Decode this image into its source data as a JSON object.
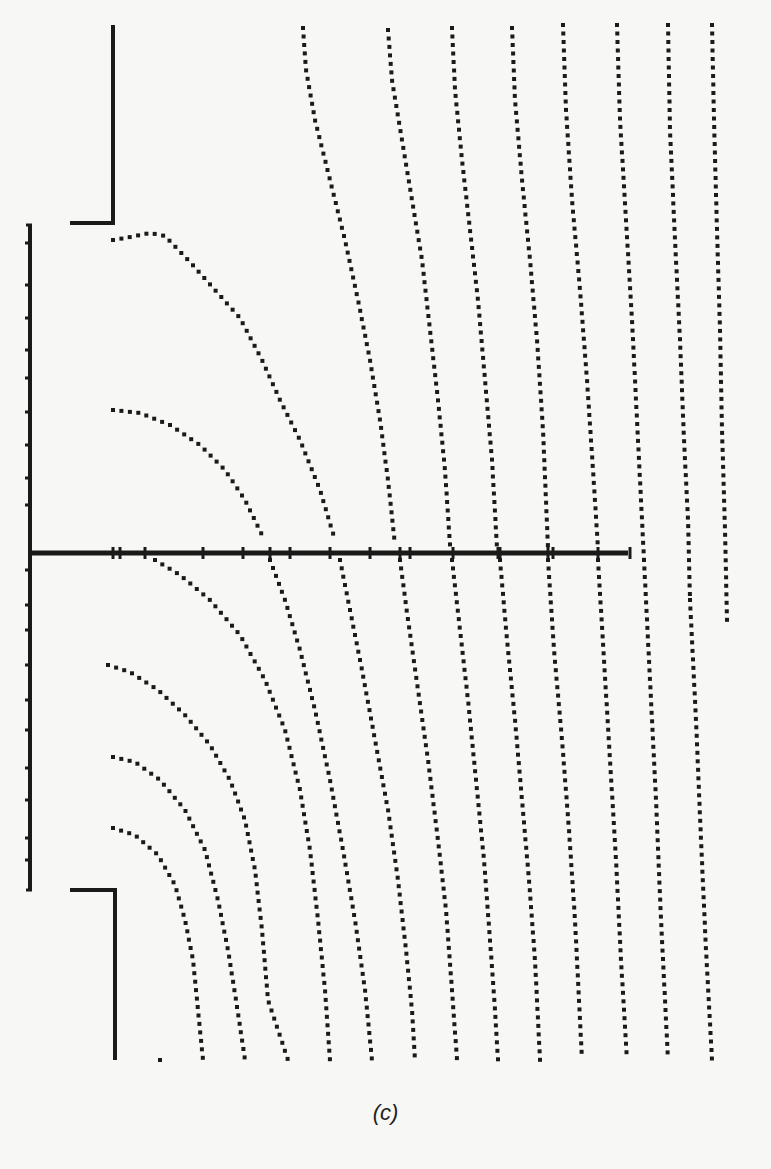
{
  "figure": {
    "caption": "(c)",
    "ink_color": "#1a1a1a",
    "paper_color": "#f7f7f5",
    "dot_size": 4
  },
  "structure": {
    "axis": {
      "x1": 30,
      "x2": 628,
      "y": 553,
      "width": 5
    },
    "axis_ticks_x": [
      113,
      120,
      145,
      203,
      243,
      270,
      290,
      330,
      370,
      400,
      410,
      453,
      498,
      500,
      548,
      553,
      598,
      630
    ],
    "left_electrode": {
      "x": 30,
      "y1": 225,
      "y2": 890,
      "width": 4
    },
    "left_ticks_y": [
      243,
      285,
      318,
      350,
      378,
      412,
      445,
      478,
      505,
      570,
      605,
      630,
      665,
      700,
      730,
      768,
      800,
      838,
      860
    ],
    "upper_plate": {
      "vx": 113,
      "vy1": 25,
      "vy2": 223,
      "hx1": 70,
      "hx2": 113
    },
    "lower_plate": {
      "vx": 115,
      "vy1": 890,
      "vy2": 1060,
      "hx1": 70,
      "hx2": 115
    }
  },
  "curves": [
    {
      "name": "arc-upper-1",
      "points": [
        [
          113,
          240
        ],
        [
          125,
          238
        ],
        [
          150,
          233
        ],
        [
          165,
          236
        ],
        [
          190,
          262
        ],
        [
          215,
          290
        ],
        [
          240,
          318
        ],
        [
          262,
          360
        ],
        [
          280,
          400
        ],
        [
          300,
          440
        ],
        [
          320,
          490
        ],
        [
          335,
          540
        ]
      ]
    },
    {
      "name": "arc-upper-2",
      "points": [
        [
          113,
          410
        ],
        [
          140,
          413
        ],
        [
          170,
          425
        ],
        [
          200,
          445
        ],
        [
          225,
          470
        ],
        [
          245,
          500
        ],
        [
          262,
          535
        ]
      ]
    },
    {
      "name": "field-1-upper",
      "points": [
        [
          303,
          28
        ],
        [
          306,
          70
        ],
        [
          315,
          120
        ],
        [
          330,
          180
        ],
        [
          345,
          240
        ],
        [
          358,
          300
        ],
        [
          370,
          360
        ],
        [
          380,
          420
        ],
        [
          388,
          480
        ],
        [
          395,
          545
        ]
      ]
    },
    {
      "name": "field-2-upper",
      "points": [
        [
          388,
          30
        ],
        [
          392,
          80
        ],
        [
          402,
          140
        ],
        [
          412,
          200
        ],
        [
          422,
          260
        ],
        [
          430,
          330
        ],
        [
          438,
          400
        ],
        [
          445,
          470
        ],
        [
          450,
          545
        ]
      ]
    },
    {
      "name": "field-3-upper",
      "points": [
        [
          452,
          28
        ],
        [
          455,
          90
        ],
        [
          462,
          160
        ],
        [
          470,
          230
        ],
        [
          478,
          300
        ],
        [
          485,
          380
        ],
        [
          492,
          460
        ],
        [
          497,
          548
        ]
      ]
    },
    {
      "name": "field-4-upper",
      "points": [
        [
          512,
          28
        ],
        [
          515,
          100
        ],
        [
          522,
          180
        ],
        [
          530,
          260
        ],
        [
          537,
          340
        ],
        [
          543,
          430
        ],
        [
          548,
          548
        ]
      ]
    },
    {
      "name": "field-5-upper",
      "points": [
        [
          563,
          25
        ],
        [
          566,
          110
        ],
        [
          572,
          200
        ],
        [
          580,
          290
        ],
        [
          587,
          380
        ],
        [
          593,
          470
        ],
        [
          598,
          548
        ]
      ]
    },
    {
      "name": "field-6-upper",
      "points": [
        [
          617,
          25
        ],
        [
          620,
          120
        ],
        [
          626,
          220
        ],
        [
          632,
          320
        ],
        [
          637,
          420
        ],
        [
          641,
          500
        ],
        [
          644,
          560
        ]
      ]
    },
    {
      "name": "field-7-upper",
      "points": [
        [
          668,
          25
        ],
        [
          670,
          130
        ],
        [
          675,
          240
        ],
        [
          680,
          340
        ],
        [
          684,
          440
        ],
        [
          688,
          520
        ],
        [
          690,
          600
        ]
      ]
    },
    {
      "name": "field-8-upper",
      "points": [
        [
          712,
          25
        ],
        [
          714,
          120
        ],
        [
          717,
          230
        ],
        [
          720,
          330
        ],
        [
          722,
          430
        ],
        [
          725,
          530
        ],
        [
          727,
          620
        ]
      ]
    },
    {
      "name": "field-1-lower",
      "points": [
        [
          155,
          560
        ],
        [
          180,
          575
        ],
        [
          210,
          600
        ],
        [
          240,
          635
        ],
        [
          265,
          680
        ],
        [
          285,
          730
        ],
        [
          300,
          790
        ],
        [
          310,
          850
        ],
        [
          318,
          920
        ],
        [
          325,
          990
        ],
        [
          330,
          1060
        ]
      ]
    },
    {
      "name": "field-2-lower",
      "points": [
        [
          270,
          560
        ],
        [
          285,
          600
        ],
        [
          300,
          650
        ],
        [
          315,
          710
        ],
        [
          330,
          780
        ],
        [
          343,
          850
        ],
        [
          355,
          920
        ],
        [
          365,
          990
        ],
        [
          372,
          1060
        ]
      ]
    },
    {
      "name": "field-3-lower",
      "points": [
        [
          340,
          560
        ],
        [
          350,
          610
        ],
        [
          362,
          670
        ],
        [
          375,
          740
        ],
        [
          388,
          810
        ],
        [
          398,
          880
        ],
        [
          406,
          950
        ],
        [
          412,
          1010
        ],
        [
          415,
          1060
        ]
      ]
    },
    {
      "name": "field-4-lower",
      "points": [
        [
          400,
          560
        ],
        [
          408,
          620
        ],
        [
          418,
          690
        ],
        [
          428,
          760
        ],
        [
          438,
          840
        ],
        [
          446,
          910
        ],
        [
          452,
          990
        ],
        [
          457,
          1060
        ]
      ]
    },
    {
      "name": "field-5-lower",
      "points": [
        [
          452,
          560
        ],
        [
          460,
          630
        ],
        [
          468,
          700
        ],
        [
          476,
          780
        ],
        [
          484,
          860
        ],
        [
          490,
          940
        ],
        [
          495,
          1010
        ],
        [
          498,
          1060
        ]
      ]
    },
    {
      "name": "field-6-lower",
      "points": [
        [
          500,
          560
        ],
        [
          507,
          640
        ],
        [
          515,
          720
        ],
        [
          522,
          800
        ],
        [
          529,
          880
        ],
        [
          535,
          960
        ],
        [
          540,
          1060
        ]
      ]
    },
    {
      "name": "field-7-lower",
      "points": [
        [
          548,
          560
        ],
        [
          554,
          650
        ],
        [
          562,
          740
        ],
        [
          569,
          830
        ],
        [
          575,
          920
        ],
        [
          579,
          1000
        ],
        [
          582,
          1060
        ]
      ]
    },
    {
      "name": "field-8-lower",
      "points": [
        [
          598,
          560
        ],
        [
          604,
          660
        ],
        [
          610,
          760
        ],
        [
          616,
          860
        ],
        [
          621,
          960
        ],
        [
          627,
          1060
        ]
      ]
    },
    {
      "name": "field-9-lower",
      "points": [
        [
          644,
          560
        ],
        [
          650,
          680
        ],
        [
          656,
          800
        ],
        [
          661,
          920
        ],
        [
          668,
          1060
        ]
      ]
    },
    {
      "name": "field-10-lower",
      "points": [
        [
          690,
          600
        ],
        [
          696,
          720
        ],
        [
          701,
          840
        ],
        [
          706,
          950
        ],
        [
          712,
          1060
        ]
      ]
    },
    {
      "name": "arc-lower-1",
      "points": [
        [
          108,
          665
        ],
        [
          130,
          672
        ],
        [
          158,
          690
        ],
        [
          185,
          715
        ],
        [
          210,
          745
        ],
        [
          230,
          780
        ],
        [
          245,
          820
        ],
        [
          255,
          870
        ],
        [
          262,
          930
        ],
        [
          268,
          1000
        ],
        [
          288,
          1060
        ]
      ]
    },
    {
      "name": "arc-lower-2",
      "points": [
        [
          113,
          757
        ],
        [
          135,
          762
        ],
        [
          160,
          780
        ],
        [
          185,
          810
        ],
        [
          205,
          850
        ],
        [
          218,
          900
        ],
        [
          228,
          950
        ],
        [
          236,
          1000
        ],
        [
          245,
          1060
        ]
      ]
    },
    {
      "name": "arc-lower-3",
      "points": [
        [
          113,
          828
        ],
        [
          135,
          835
        ],
        [
          158,
          855
        ],
        [
          175,
          885
        ],
        [
          185,
          920
        ],
        [
          193,
          960
        ],
        [
          198,
          1010
        ],
        [
          203,
          1060
        ]
      ]
    },
    {
      "name": "stray-dot",
      "points": [
        [
          160,
          1060
        ]
      ]
    }
  ]
}
